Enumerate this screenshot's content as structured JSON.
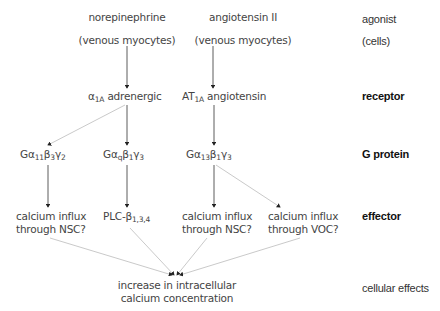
{
  "diagram": {
    "agonists": [
      {
        "name": "norepinephrine",
        "cells": "(venous myocytes)"
      },
      {
        "name": "angiotensin II",
        "cells": "(venous myocytes)"
      }
    ],
    "receptors": [
      {
        "symbol": "α",
        "sub": "1A",
        "name": "adrenergic"
      },
      {
        "symbol": "AT",
        "sub": "1A",
        "name": "angiotensin"
      }
    ],
    "g_proteins": [
      {
        "a": "Gα",
        "a_sub": "11",
        "b": "β",
        "b_sub": "3",
        "g": "γ",
        "g_sub": "2"
      },
      {
        "a": "Gα",
        "a_sub": "q",
        "b": "β",
        "b_sub": "1",
        "g": "γ",
        "g_sub": "3"
      },
      {
        "a": "Gα",
        "a_sub": "13",
        "b": "β",
        "b_sub": "1",
        "g": "γ",
        "g_sub": "3"
      }
    ],
    "effectors": [
      {
        "line1": "calcium influx",
        "line2": "through NSC?"
      },
      {
        "main": "PLC-β",
        "sub": "1,3,4"
      },
      {
        "line1": "calcium influx",
        "line2": "through NSC?"
      },
      {
        "line1": "calcium influx",
        "line2": "through VOC?"
      }
    ],
    "outcome": {
      "line1": "increase in intracellular",
      "line2": "calcium concentration"
    },
    "row_labels": {
      "agonist": "agonist",
      "cells": "(cells)",
      "receptor": "receptor",
      "g_protein": "G protein",
      "effector": "effector",
      "cellular_effects": "cellular effects"
    },
    "colors": {
      "arrow_dark": "#333333",
      "arrow_light": "#bbbbbb",
      "text": "#444444"
    }
  }
}
